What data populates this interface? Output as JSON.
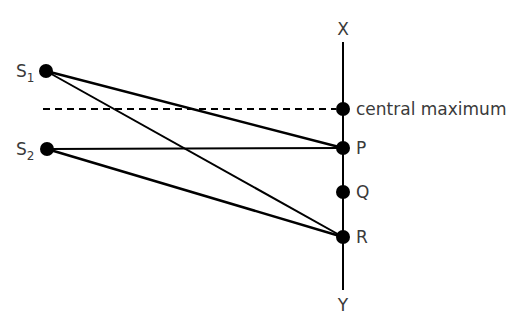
{
  "diagram": {
    "sources": [
      {
        "name": "S",
        "subscript": "1"
      },
      {
        "name": "S",
        "subscript": "2"
      }
    ],
    "screen": {
      "top_label": "X",
      "bottom_label": "Y"
    },
    "points": {
      "central": "central maximum",
      "p": "P",
      "q": "Q",
      "r": "R"
    },
    "colors": {
      "line": "#000000",
      "text": "#3a3a3a"
    }
  }
}
